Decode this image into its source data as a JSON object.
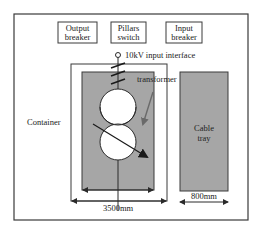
{
  "diagram": {
    "colors": {
      "stroke": "#3a3a3a",
      "fill_grey": "#a6a6a6",
      "background": "#ffffff",
      "text": "#222222"
    },
    "top_boxes": [
      {
        "line1": "Output",
        "line2": "breaker"
      },
      {
        "line1": "Pillars",
        "line2": "switch"
      },
      {
        "line1": "Input",
        "line2": "breaker"
      }
    ],
    "input_interface_label": "10kV input interface",
    "transformer_label": "transformer",
    "container_label": "Container",
    "cable_tray": {
      "line1": "Cable",
      "line2": "tray"
    },
    "dimensions": {
      "container_width": "3500mm",
      "cable_tray_width": "800mm"
    }
  }
}
